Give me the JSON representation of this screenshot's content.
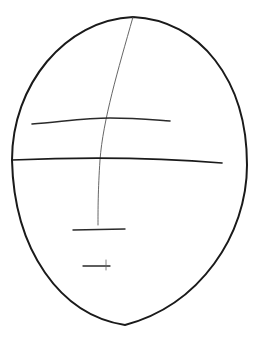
{
  "image": {
    "subject": "pencil sketch of face proportion guide",
    "background": "#ffffff",
    "stroke_color": "#1a1a1a",
    "guide_color": "#555555"
  },
  "sketch": {
    "head_outline": "M133,17 C200,20 247,80 247,165 C247,235 200,305 125,325 C60,315 14,250 12,160 C12,85 65,20 133,17 Z",
    "center_guide": "M133,17 C118,70 103,120 100,160 C98,190 98,210 98,225",
    "eye_line": "M32,124 C60,122 85,118 110,118 C135,118 155,120 170,121",
    "horizontal_midline": "M12,160 C80,157 150,157 222,163",
    "nose_line": "M73,230 L125,229",
    "mouth_line": "M83,266 L110,266",
    "mouth_tick": "M106,260 L106,270"
  }
}
